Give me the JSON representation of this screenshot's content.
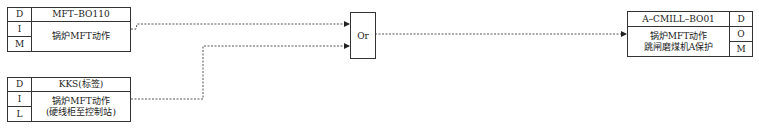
{
  "inputs": [
    {
      "flags": [
        "D",
        "I",
        "M"
      ],
      "tag": "MFT–BO110",
      "description": "锅炉MFT动作",
      "description_line2": ""
    },
    {
      "flags": [
        "D",
        "I",
        "L"
      ],
      "tag": "KKS(标签)",
      "description": "锅炉MFT动作",
      "description_line2": "(硬线柜至控制站)"
    }
  ],
  "gate": {
    "label": "Or"
  },
  "output": {
    "tag": "A–CMILL–BO01",
    "description": "锅炉MFT动作",
    "description_line2": "跳闸磨煤机A保护",
    "flags": [
      "D",
      "O",
      "M"
    ]
  },
  "colors": {
    "line": "#333333",
    "wire": "#555555",
    "background": "#ffffff"
  }
}
